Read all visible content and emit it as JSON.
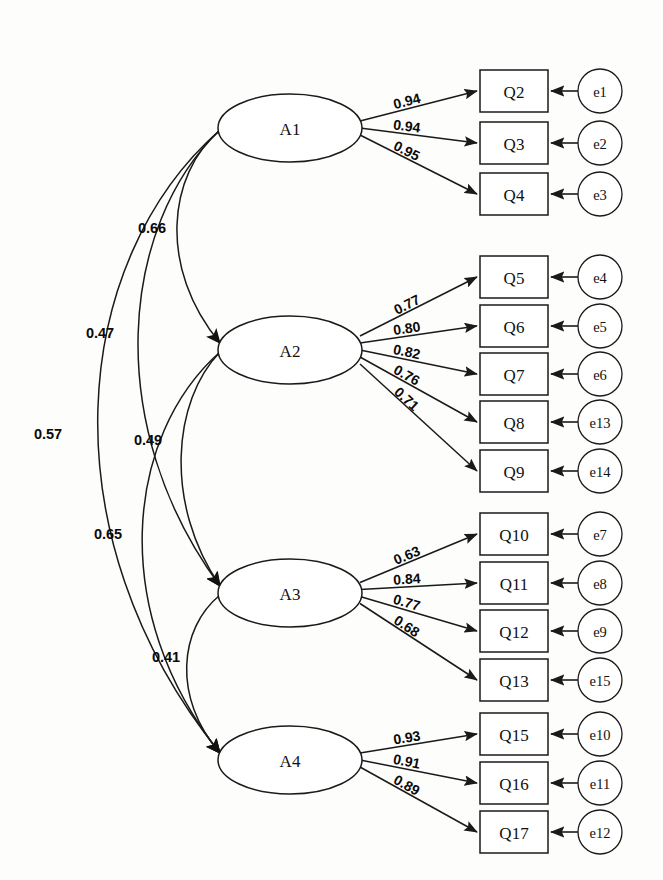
{
  "diagram": {
    "type": "cfa-path-diagram",
    "background_color": "#fdfdfc",
    "line_color": "#1a1a1a",
    "caption": ""
  },
  "factors": [
    {
      "id": "A1",
      "label": "A1",
      "cx": 290,
      "cy": 128,
      "rx": 72,
      "ry": 34,
      "indicators": [
        {
          "label": "Q2",
          "loading": "0.94",
          "error": "e1",
          "y": 70
        },
        {
          "label": "Q3",
          "loading": "0.94",
          "error": "e2",
          "y": 122
        },
        {
          "label": "Q4",
          "loading": "0.95",
          "error": "e3",
          "y": 173
        }
      ]
    },
    {
      "id": "A2",
      "label": "A2",
      "cx": 290,
      "cy": 350,
      "rx": 72,
      "ry": 34,
      "indicators": [
        {
          "label": "Q5",
          "loading": "0.77",
          "error": "e4",
          "y": 256
        },
        {
          "label": "Q6",
          "loading": "0.80",
          "error": "e5",
          "y": 305
        },
        {
          "label": "Q7",
          "loading": "0.82",
          "error": "e6",
          "y": 353
        },
        {
          "label": "Q8",
          "loading": "0.76",
          "error": "e13",
          "y": 401
        },
        {
          "label": "Q9",
          "loading": "0.71",
          "error": "e14",
          "y": 450
        }
      ]
    },
    {
      "id": "A3",
      "label": "A3",
      "cx": 290,
      "cy": 593,
      "rx": 72,
      "ry": 34,
      "indicators": [
        {
          "label": "Q10",
          "loading": "0.63",
          "error": "e7",
          "y": 513
        },
        {
          "label": "Q11",
          "loading": "0.84",
          "error": "e8",
          "y": 562
        },
        {
          "label": "Q12",
          "loading": "0.77",
          "error": "e9",
          "y": 610
        },
        {
          "label": "Q13",
          "loading": "0.68",
          "error": "e15",
          "y": 659
        }
      ]
    },
    {
      "id": "A4",
      "label": "A4",
      "cx": 290,
      "cy": 760,
      "rx": 72,
      "ry": 34,
      "indicators": [
        {
          "label": "Q15",
          "loading": "0.93",
          "error": "e10",
          "y": 713
        },
        {
          "label": "Q16",
          "loading": "0.91",
          "error": "e11",
          "y": 762
        },
        {
          "label": "Q17",
          "loading": "0.89",
          "error": "e12",
          "y": 811
        }
      ]
    }
  ],
  "covariances": [
    {
      "from": "A1",
      "to": "A2",
      "value": "0.66",
      "label_x": 152,
      "label_y": 228,
      "bow": 62
    },
    {
      "from": "A1",
      "to": "A3",
      "value": "0.47",
      "label_x": 100,
      "label_y": 333,
      "bow": 118
    },
    {
      "from": "A1",
      "to": "A4",
      "value": "0.57",
      "label_x": 48,
      "label_y": 434,
      "bow": 176
    },
    {
      "from": "A2",
      "to": "A3",
      "value": "0.49",
      "label_x": 148,
      "label_y": 440,
      "bow": 56
    },
    {
      "from": "A2",
      "to": "A4",
      "value": "0.65",
      "label_x": 108,
      "label_y": 534,
      "bow": 112
    },
    {
      "from": "A3",
      "to": "A4",
      "value": "0.41",
      "label_x": 166,
      "label_y": 657,
      "bow": 48
    }
  ],
  "geometry": {
    "box_x": 480,
    "box_width": 68,
    "box_height": 42,
    "error_cx": 600,
    "error_r": 22
  },
  "chart_data": {
    "type": "diagram",
    "model": "4-factor confirmatory factor analysis",
    "factor_count": 4,
    "indicator_count": 15,
    "error_count": 15,
    "standardized_loadings": {
      "A1": {
        "Q2": 0.94,
        "Q3": 0.94,
        "Q4": 0.95
      },
      "A2": {
        "Q5": 0.77,
        "Q6": 0.8,
        "Q7": 0.82,
        "Q8": 0.76,
        "Q9": 0.71
      },
      "A3": {
        "Q10": 0.63,
        "Q11": 0.84,
        "Q12": 0.77,
        "Q13": 0.68
      },
      "A4": {
        "Q15": 0.93,
        "Q16": 0.91,
        "Q17": 0.89
      }
    },
    "factor_correlations": {
      "A1-A2": 0.66,
      "A1-A3": 0.47,
      "A1-A4": 0.57,
      "A2-A3": 0.49,
      "A2-A4": 0.65,
      "A3-A4": 0.41
    }
  }
}
